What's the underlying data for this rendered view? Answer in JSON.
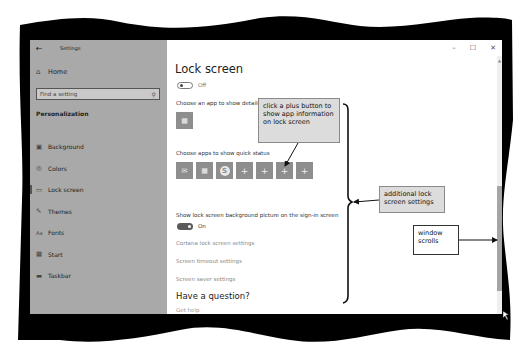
{
  "window": {
    "title": "Settings",
    "back_icon": "←",
    "controls": {
      "minimize": "–",
      "maximize": "☐",
      "close": "✕"
    }
  },
  "sidebar": {
    "home": {
      "label": "Home",
      "icon": "⌂"
    },
    "search": {
      "placeholder": "Find a setting",
      "icon": "⚲"
    },
    "section": "Personalization",
    "items": [
      {
        "label": "Background",
        "icon": "▣"
      },
      {
        "label": "Colors",
        "icon": "◎"
      },
      {
        "label": "Lock screen",
        "icon": "▭",
        "active": true
      },
      {
        "label": "Themes",
        "icon": "✎"
      },
      {
        "label": "Fonts",
        "icon": "Aa"
      },
      {
        "label": "Start",
        "icon": "▦"
      },
      {
        "label": "Taskbar",
        "icon": "▬"
      }
    ]
  },
  "main": {
    "title": "Lock screen",
    "top_toggle": {
      "state": "Off"
    },
    "detail_label": "Choose an app to show detailed status",
    "detail_app_icon": "calendar",
    "quick_label": "Choose apps to show quick status",
    "quick_tiles": [
      {
        "icon": "mail",
        "glyph": "✉"
      },
      {
        "icon": "calendar",
        "glyph": "▦"
      },
      {
        "icon": "skype",
        "glyph": "S"
      },
      {
        "icon": "plus",
        "glyph": "+"
      },
      {
        "icon": "plus",
        "glyph": "+"
      },
      {
        "icon": "plus",
        "glyph": "+"
      },
      {
        "icon": "plus",
        "glyph": "+"
      }
    ],
    "signin_label": "Show lock screen background picture on the sign-in screen",
    "signin_toggle": {
      "state": "On"
    },
    "links": [
      "Cortana lock screen settings",
      "Screen timeout settings",
      "Screen saver settings"
    ],
    "question_heading": "Have a question?",
    "get_help": "Get help"
  },
  "callouts": {
    "plus_button": "click a plus button to show app information on lock screen",
    "additional": "additional lock screen settings",
    "scrolls": "window scrolls"
  },
  "colors": {
    "sidebar_bg": "#a9a9a9",
    "tile_bg": "#8e8e8e",
    "callout_shaded": "#dcdcdc",
    "frame": "#000000"
  }
}
